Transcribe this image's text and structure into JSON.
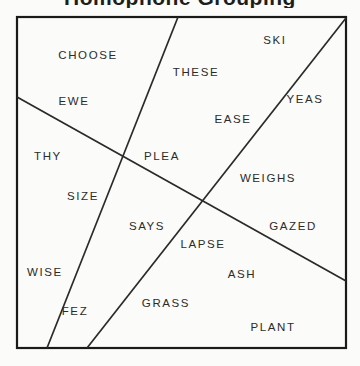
{
  "title": {
    "text": "Homophone Grouping",
    "visible_note": "partially-cropped-at-top"
  },
  "figure": {
    "name": "word-region-diagram",
    "background_color": "#fbfbf9",
    "border_color": "#1a1a1a",
    "line_color": "#2a2a2a",
    "text_color": "#2b2b2b",
    "box": {
      "x": 17,
      "y": 17,
      "width": 329,
      "height": 331
    },
    "lines": [
      {
        "id": "line-1",
        "x1": 178,
        "y1": 17,
        "x2": 47,
        "y2": 348
      },
      {
        "id": "line-2",
        "x1": 17,
        "y1": 97,
        "x2": 346,
        "y2": 281
      },
      {
        "id": "line-3",
        "x1": 87,
        "y1": 348,
        "x2": 346,
        "y2": 18
      }
    ],
    "words": [
      {
        "label": "CHOOSE",
        "x": 88,
        "y": 55
      },
      {
        "label": "SKI",
        "x": 275,
        "y": 40
      },
      {
        "label": "THESE",
        "x": 196,
        "y": 72
      },
      {
        "label": "EWE",
        "x": 74,
        "y": 101
      },
      {
        "label": "YEAS",
        "x": 305,
        "y": 99
      },
      {
        "label": "EASE",
        "x": 233,
        "y": 119
      },
      {
        "label": "THY",
        "x": 48,
        "y": 156
      },
      {
        "label": "PLEA",
        "x": 162,
        "y": 156
      },
      {
        "label": "WEIGHS",
        "x": 268,
        "y": 178
      },
      {
        "label": "SIZE",
        "x": 83,
        "y": 196
      },
      {
        "label": "SAYS",
        "x": 147,
        "y": 226
      },
      {
        "label": "GAZED",
        "x": 293,
        "y": 226
      },
      {
        "label": "LAPSE",
        "x": 203,
        "y": 244
      },
      {
        "label": "WISE",
        "x": 45,
        "y": 272
      },
      {
        "label": "ASH",
        "x": 242,
        "y": 274
      },
      {
        "label": "FEZ",
        "x": 75,
        "y": 311
      },
      {
        "label": "GRASS",
        "x": 166,
        "y": 303
      },
      {
        "label": "PLANT",
        "x": 273,
        "y": 327
      }
    ]
  }
}
